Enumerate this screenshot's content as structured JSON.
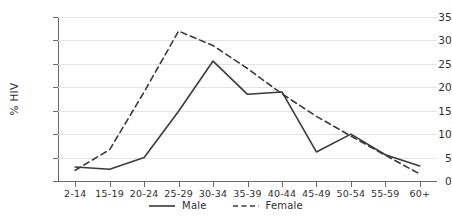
{
  "chart_data": {
    "type": "line",
    "title": "",
    "subtitle": "",
    "xlabel": "",
    "ylabel": "% HIV",
    "categories": [
      "2-14",
      "15-19",
      "20-24",
      "25-29",
      "30-34",
      "35-39",
      "40-44",
      "45-49",
      "50-54",
      "55-59",
      "60+"
    ],
    "series": [
      {
        "name": "Male",
        "style": "solid",
        "color": "#3a3a3a",
        "values": [
          3.0,
          2.5,
          5.0,
          14.9,
          25.6,
          18.5,
          19.0,
          6.2,
          10.0,
          5.6,
          3.2
        ]
      },
      {
        "name": "Female",
        "style": "dashed",
        "color": "#3a3a3a",
        "values": [
          2.3,
          6.7,
          19.0,
          32.0,
          28.9,
          24.0,
          18.6,
          13.8,
          9.6,
          5.5,
          1.5
        ]
      }
    ],
    "ylim": [
      0,
      35
    ],
    "yticks": [
      0,
      5,
      10,
      15,
      20,
      25,
      30,
      35
    ],
    "ytick_labels": [
      "0",
      "5",
      "10",
      "15",
      "20",
      "25",
      "30",
      "35"
    ],
    "grid": true,
    "legend_position": "bottom"
  },
  "legend": {
    "entries": [
      {
        "label": "Male",
        "icon": "solid-line-swatch"
      },
      {
        "label": "Female",
        "icon": "dashed-line-swatch"
      }
    ]
  },
  "colors": {
    "line": "#3a3a3a",
    "grid": "#e3e3e3",
    "axis": "#6a6a6a",
    "text": "#2e2e2e",
    "background": "#ffffff"
  }
}
